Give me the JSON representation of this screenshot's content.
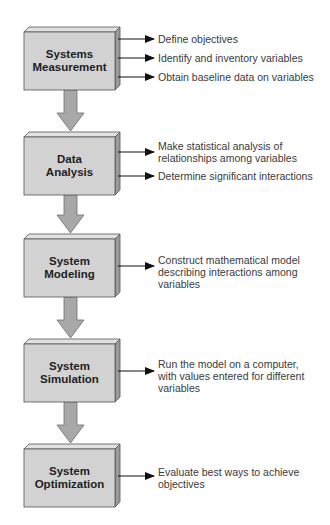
{
  "diagram": {
    "type": "flowchart",
    "colors": {
      "box_front": "#d2d2d2",
      "box_top": "#e2e2e2",
      "box_side": "#9a9a9a",
      "box_border": "#555555",
      "connector_fill": "#a8a8a8",
      "connector_border": "#6e6e6e",
      "arrow": "#111111",
      "label_text": "#1e1e1e",
      "note_text": "#3a3a3a"
    },
    "steps": [
      {
        "title_line1": "Systems",
        "title_line2": "Measurement",
        "notes": [
          {
            "line1": "Define objectives"
          },
          {
            "line1": "Identify and inventory variables"
          },
          {
            "line1": "Obtain baseline data on variables"
          }
        ]
      },
      {
        "title_line1": "Data",
        "title_line2": "Analysis",
        "notes": [
          {
            "line1": "Make statistical analysis of",
            "line2": "relationships among variables"
          },
          {
            "line1": "Determine significant interactions"
          }
        ]
      },
      {
        "title_line1": "System",
        "title_line2": "Modeling",
        "notes": [
          {
            "line1": "Construct mathematical model",
            "line2": "describing interactions among",
            "line3": "variables"
          }
        ]
      },
      {
        "title_line1": "System",
        "title_line2": "Simulation",
        "notes": [
          {
            "line1": "Run the model on a computer,",
            "line2": "with values entered for different",
            "line3": "variables"
          }
        ]
      },
      {
        "title_line1": "System",
        "title_line2": "Optimization",
        "notes": [
          {
            "line1": "Evaluate best ways to achieve",
            "line2": "objectives"
          }
        ]
      }
    ]
  }
}
